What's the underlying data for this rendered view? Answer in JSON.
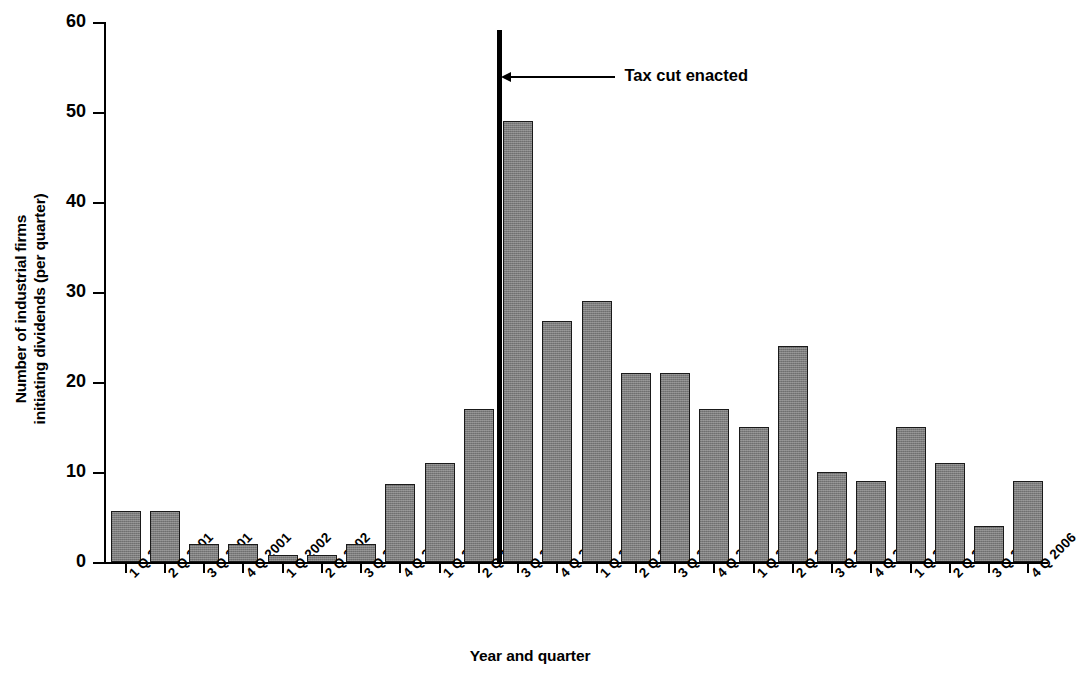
{
  "chart_data": {
    "type": "bar",
    "title": "",
    "xlabel": "Year and quarter",
    "ylabel": "Number of industrial firms initiating dividends (per quarter)",
    "ylabel_line1": "Number of industrial firms",
    "ylabel_line2": "initiating dividends (per quarter)",
    "ylim": [
      0,
      60
    ],
    "yticks": [
      0,
      10,
      20,
      30,
      40,
      50,
      60
    ],
    "ytick_labels": [
      "0",
      "10",
      "20",
      "30",
      "40",
      "50",
      "60"
    ],
    "grid": false,
    "legend": false,
    "bar_color": "#7c7c7c",
    "bar_edge_color": "#1a1a1a",
    "categories": [
      "1 Q 2001",
      "2 Q 2001",
      "3 Q 2001",
      "4 Q 2001",
      "1 Q 2002",
      "2 Q 2002",
      "3 Q 2002",
      "4 Q 2002",
      "1 Q 2003",
      "2 Q 2003",
      "3 Q 2003",
      "4 Q 2003",
      "1 Q 2004",
      "2 Q 2004",
      "3 Q 2004",
      "4 Q 2004",
      "1 Q 2005",
      "2 Q 2005",
      "3 Q 2005",
      "4 Q 2005",
      "1 Q 2006",
      "2 Q 2006",
      "3 Q 2006",
      "4 Q 2006"
    ],
    "values": [
      5.7,
      5.7,
      2,
      2,
      0.8,
      0.8,
      2,
      8.7,
      11,
      17,
      49,
      26.8,
      29,
      21,
      21,
      17,
      15,
      24,
      10,
      9,
      15,
      11,
      4,
      9
    ],
    "annotations": [
      {
        "name": "tax-cut-enacted",
        "label": "Tax cut enacted",
        "type": "vertical-line-with-arrow",
        "at_category_boundary": "between 2 Q 2003 and 3 Q 2003",
        "line_color": "#000000"
      }
    ]
  }
}
